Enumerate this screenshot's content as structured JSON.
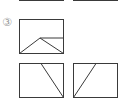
{
  "problem": {
    "number_label": "③"
  },
  "figures": [
    {
      "name": "composite-figure",
      "description": "rectangle with inner triangle and horizontal segment"
    },
    {
      "name": "option-left",
      "description": "rectangle with diagonal from top to bottom-right"
    },
    {
      "name": "option-right",
      "description": "rectangle with diagonal from top to bottom-left"
    }
  ],
  "colors": {
    "line": "#3a3a3a",
    "label": "#9a9a9a"
  }
}
